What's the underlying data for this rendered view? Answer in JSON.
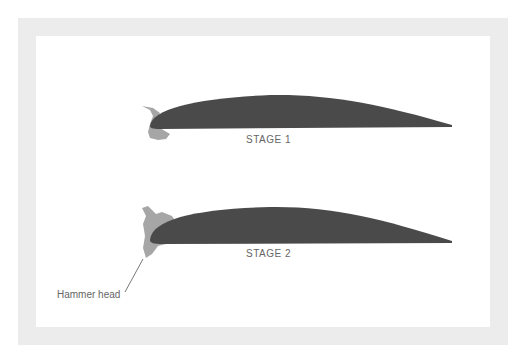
{
  "figure": {
    "stages": [
      {
        "label": "STAGE 1"
      },
      {
        "label": "STAGE 2"
      }
    ],
    "annotation": {
      "label": "Hammer head"
    },
    "colors": {
      "blade": "#4a4a4a",
      "deposit": "#a6a6a6",
      "frame": "#ececec",
      "text": "#666666"
    }
  }
}
